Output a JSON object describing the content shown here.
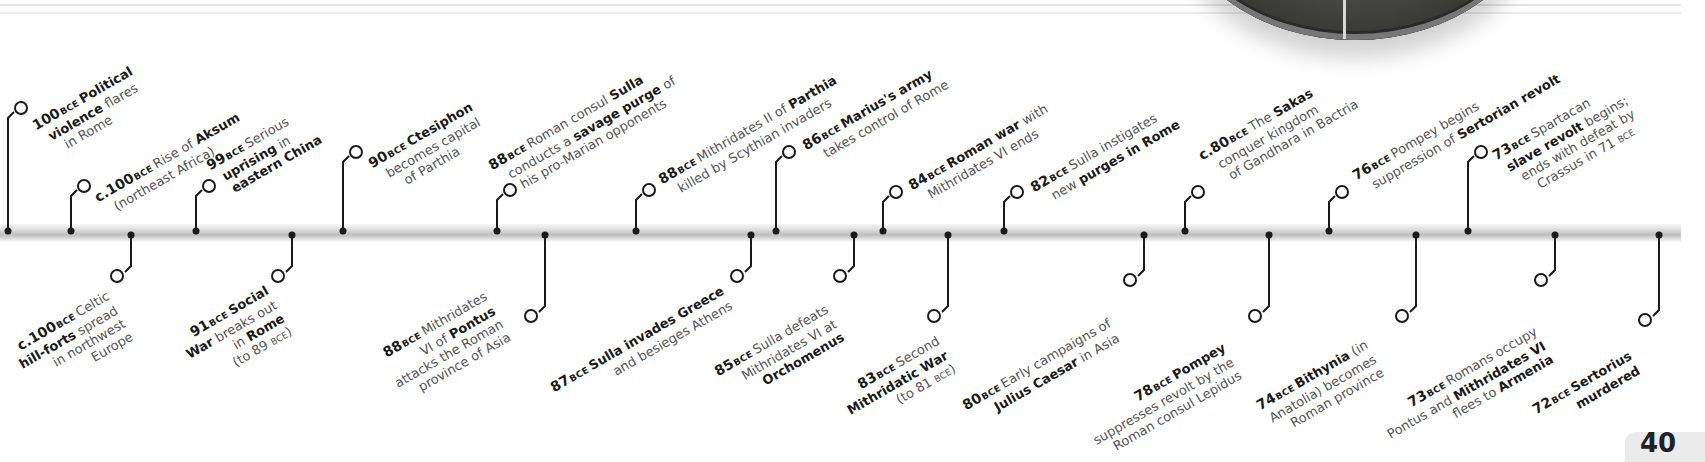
{
  "timeline": {
    "era_label": "BCE",
    "above": [
      {
        "x": 8,
        "lines": [
          [
            "100",
            "Political"
          ],
          [
            "violence",
            " flares"
          ],
          [
            "in Rome"
          ]
        ],
        "year": "100",
        "bold": [
          "Political violence"
        ],
        "text": "100 BCE Political violence flares in Rome"
      },
      {
        "x": 67,
        "lines": [],
        "year": "c.100",
        "text": "c.100 BCE Rise of Aksum (northeast Africa)"
      },
      {
        "x": 190,
        "year": "99",
        "text": "99 BCE Serious uprising in eastern China"
      },
      {
        "x": 331,
        "year": "90",
        "text": "90 BCE Ctesiphon becomes capital of Parthia"
      },
      {
        "x": 490,
        "year": "88",
        "text": "88 BCE Roman consul Sulla conducts a savage purge of his pro-Marian opponents"
      },
      {
        "x": 627,
        "year": "88",
        "text": "88 BCE Mithridates II of Parthia killed by Scythian invaders"
      },
      {
        "x": 765,
        "year": "86",
        "text": "86 BCE Marius's army takes control of Rome"
      },
      {
        "x": 868,
        "year": "84",
        "text": "84 BCE Roman war with Mithridates VI ends"
      },
      {
        "x": 989,
        "year": "82",
        "text": "82 BCE Sulla instigates new purges in Rome"
      },
      {
        "x": 1182,
        "year": "c.80",
        "text": "c.80 BCE The Sakas conquer kingdom of Gandhara in Bactria"
      },
      {
        "x": 1331,
        "year": "76",
        "text": "76 BCE Pompey begins suppression of Sertorian revolt"
      },
      {
        "x": 1472,
        "year": "73",
        "text": "73 BCE Spartacan slave revolt begins; ends with defeat by Crassus in 71 BCE"
      }
    ],
    "below": [
      {
        "x": 131,
        "year": "c.100",
        "text": "c.100 BCE Celtic hill-forts spread in northwest Europe"
      },
      {
        "x": 291,
        "year": "91",
        "text": "91 BCE Social War breaks out in Rome (to 89 BCE)"
      },
      {
        "x": 545,
        "year": "88",
        "text": "88 BCE Mithridates VI of Pontus attacks the Roman province of Asia"
      },
      {
        "x": 751,
        "year": "87",
        "text": "87 BCE Sulla invades Greece and besieges Athens"
      },
      {
        "x": 854,
        "year": "85",
        "text": "85 BCE Sulla defeats Mithridates VI at Orchomenus"
      },
      {
        "x": 948,
        "year": "83",
        "text": "83 BCE Second Mithridatic War (to 81 BCE)"
      },
      {
        "x": 1144,
        "year": "80",
        "text": "80 BCE Early campaigns of Julius Caesar in Asia"
      },
      {
        "x": 1270,
        "year": "78",
        "text": "78 BCE Pompey suppresses revolt by the Roman consul Lepidus"
      },
      {
        "x": 1416,
        "year": "74",
        "text": "74 BCE Bithynia (in Anatolia) becomes Roman province"
      },
      {
        "x": 1556,
        "year": "73",
        "text": "73 BCE Romans occupy Pontus and Mithridates VI flees to Armenia"
      },
      {
        "x": 1659,
        "year": "72",
        "text": "72 BCE Sertorius murdered"
      }
    ]
  },
  "labels": {
    "e01": {
      "yr": "100",
      "l1b": "Political",
      "l2b": "violence",
      "l2": " flares",
      "l3": "in Rome"
    },
    "e02": {
      "yr": "c.100",
      "l1": "Rise of ",
      "l1b": "Aksum",
      "l2": "(northeast Africa)"
    },
    "e03": {
      "yr": "99",
      "l1": "Serious",
      "l2b": "uprising",
      "l2": " in",
      "l3b": "eastern China"
    },
    "e04": {
      "yr": "90",
      "l1b": "Ctesiphon",
      "l2": "becomes capital",
      "l3": "of Parthia"
    },
    "e05": {
      "yr": "88",
      "l1": "Roman consul ",
      "l1b": "Sulla",
      "l2": "conducts a ",
      "l2b": "savage purge",
      "l2c": " of",
      "l3": "his pro-Marian opponents"
    },
    "e06": {
      "yr": "88",
      "l1": "Mithridates II of ",
      "l1b": "Parthia",
      "l2": "killed by Scythian invaders"
    },
    "e07": {
      "yr": "86",
      "l1b": "Marius's army",
      "l2": "takes control of Rome"
    },
    "e08": {
      "yr": "84",
      "l1b": "Roman war",
      "l1": " with",
      "l2": "Mithridates VI ends"
    },
    "e09": {
      "yr": "82",
      "l1": "Sulla instigates",
      "l2": "new ",
      "l2b": "purges in Rome"
    },
    "e10": {
      "yr": "c.80",
      "l1": "The ",
      "l1b": "Sakas",
      "l2": "conquer kingdom",
      "l3": "of Gandhara in Bactria"
    },
    "e11": {
      "yr": "76",
      "l1": "Pompey begins",
      "l2": "suppression of ",
      "l2b": "Sertorian revolt"
    },
    "e12": {
      "yr": "73",
      "l1": "Spartacan",
      "l2b": "slave revolt",
      "l2": " begins;",
      "l3": "ends with defeat by",
      "l4": "Crassus in 71 ",
      "l4e": "BCE"
    },
    "f01": {
      "yr": "c.100",
      "l1": "Celtic",
      "l2b": "hill-forts",
      "l2": " spread",
      "l3": "in northwest",
      "l4": "Europe"
    },
    "f02": {
      "yr": "91",
      "l1b": "Social",
      "l2b": "War",
      "l2": " breaks out",
      "l3": "in ",
      "l3b": "Rome",
      "l4": "(to 89 ",
      "l4e": "BCE",
      "l4c": ")"
    },
    "f03": {
      "yr": "88",
      "l1": "Mithridates",
      "l2": "VI of ",
      "l2b": "Pontus",
      "l3": "attacks the Roman",
      "l4": "province of Asia"
    },
    "f04": {
      "yr": "87",
      "l1b": "Sulla invades Greece",
      "l2": "and besieges Athens"
    },
    "f05": {
      "yr": "85",
      "l1": "Sulla defeats",
      "l2": "Mithridates VI at",
      "l3b": "Orchomenus"
    },
    "f06": {
      "yr": "83",
      "l1": "Second",
      "l2b": "Mithridatic War",
      "l3": "(to 81 ",
      "l3e": "BCE",
      "l3c": ")"
    },
    "f07": {
      "yr": "80",
      "l1": "Early campaigns of",
      "l2b": "Julius Caesar",
      "l2": " in Asia"
    },
    "f08": {
      "yr": "78",
      "l1b": "Pompey",
      "l2": "suppresses revolt by the",
      "l3": "Roman consul Lepidus"
    },
    "f09": {
      "yr": "74",
      "l1b": "Bithynia",
      "l1": " (in",
      "l2": "Anatolia) becomes",
      "l3": "Roman province"
    },
    "f10": {
      "yr": "73",
      "l1": "Romans occupy",
      "l2": "Pontus and ",
      "l2b": "Mithridates VI",
      "l3": "flees to ",
      "l3b": "Armenia"
    },
    "f11": {
      "yr": "72",
      "l1b": "Sertorius",
      "l2b": "murdered"
    }
  },
  "era": "BCE",
  "page": {
    "number": "40"
  },
  "colors": {
    "line": "#1a1a1a",
    "axis": "#c8c8c8",
    "text": "#555555",
    "bold": "#1a1a1a"
  }
}
